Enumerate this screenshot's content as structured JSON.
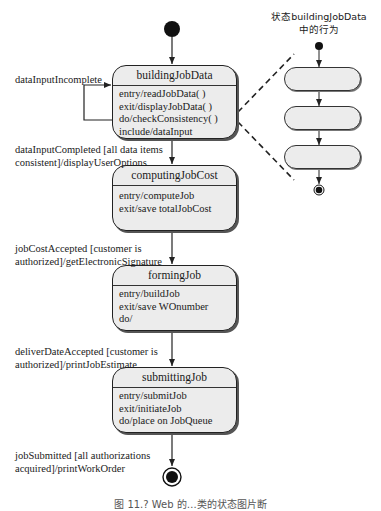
{
  "diagram": {
    "type": "UML state diagram",
    "states": [
      {
        "name": "buildingJobData",
        "actions": [
          "entry/readJobData( )",
          "exit/displayJobData( )",
          "do/checkConsistency( )",
          "include/dataInput"
        ]
      },
      {
        "name": "computingJobCost",
        "actions": [
          "entry/computeJob",
          "exit/save totalJobCost"
        ]
      },
      {
        "name": "formingJob",
        "actions": [
          "entry/buildJob",
          "exit/save WOnumber",
          "do/"
        ]
      },
      {
        "name": "submittingJob",
        "actions": [
          "entry/submitJob",
          "exit/initiateJob",
          "do/place on JobQueue"
        ]
      }
    ],
    "transitions": {
      "self_loop": "dataInputIncomplete",
      "t1": [
        "dataInputCompleted [all data items",
        "consistent]/displayUserOptions"
      ],
      "t2": [
        "jobCostAccepted [customer is",
        "authorized]/getElectronicSignature"
      ],
      "t3": [
        "deliverDateAccepted [customer is",
        "authorized]/printJobEstimate"
      ],
      "t4": [
        "jobSubmitted [all authorizations",
        "acquired]/printWorkOrder"
      ]
    },
    "substate_view": {
      "title_line1": "状态buildingJobData",
      "title_line2": "中的行为",
      "pill_count": 3
    },
    "caption": "图 11.? Web 的…类的状态图片断"
  }
}
